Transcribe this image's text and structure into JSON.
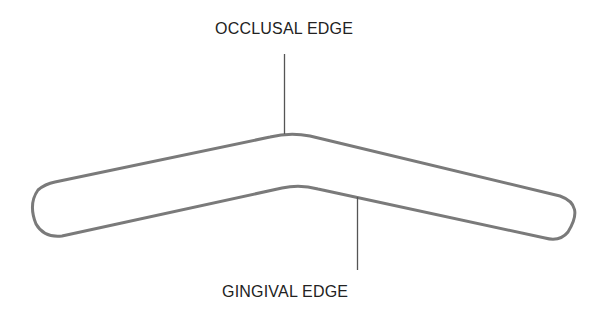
{
  "diagram": {
    "labels": {
      "top": "OCCLUSAL EDGE",
      "bottom": "GINGIVAL EDGE"
    },
    "colors": {
      "outline": "#7a7a7a",
      "leader": "#555555",
      "text": "#222222",
      "background": "#ffffff"
    }
  }
}
